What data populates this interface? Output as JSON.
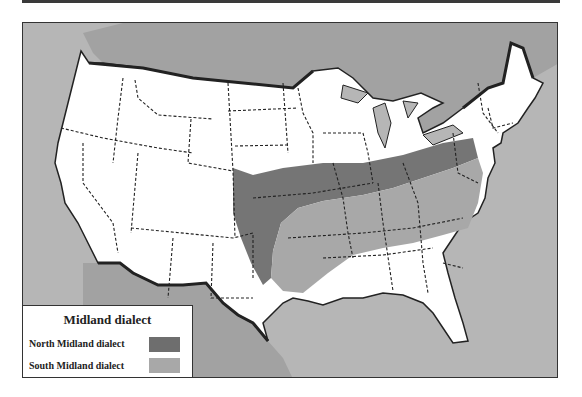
{
  "map": {
    "title": "Midland dialect",
    "colors": {
      "ocean": "#b6b6b6",
      "foreign_land": "#a2a2a2",
      "us_land": "#ffffff",
      "north_midland": "#6e6e6e",
      "south_midland": "#a8a8a8",
      "border": "#222222"
    },
    "legend": {
      "title": "Midland dialect",
      "items": [
        {
          "label": "North Midland dialect",
          "color": "#6e6e6e"
        },
        {
          "label": "South Midland dialect",
          "color": "#a8a8a8"
        }
      ]
    }
  }
}
